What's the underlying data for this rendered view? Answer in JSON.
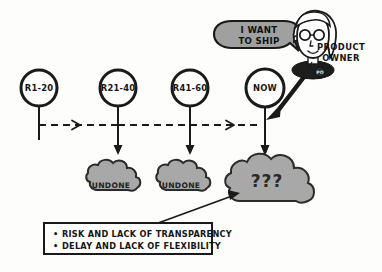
{
  "diagram": {
    "background_color": "#fdfdfc",
    "ink_color": "#1a1a1a",
    "cloud_fill": "#a8a8a8",
    "bubble_fill": "#a0a0a0"
  },
  "timeline": {
    "style": "dashed",
    "nodes": [
      {
        "label": "R1-20",
        "shape": "circle"
      },
      {
        "label": "R21-40",
        "shape": "circle"
      },
      {
        "label": "R41-60",
        "shape": "circle"
      },
      {
        "label": "NOW",
        "shape": "circle"
      }
    ]
  },
  "clouds": [
    {
      "label": "UNDONE",
      "size": "small"
    },
    {
      "label": "UNDONE",
      "size": "small"
    },
    {
      "label": "???",
      "size": "large"
    }
  ],
  "speech_bubble": {
    "lines": [
      "I WANT",
      "TO SHIP"
    ]
  },
  "character": {
    "role_lines": [
      "PRODUCT",
      "OWNER"
    ],
    "badge": "PO"
  },
  "callout": {
    "bullets": [
      "RISK AND LACK OF TRANSPARENCY",
      "DELAY AND LACK OF FLEXIBILITY"
    ],
    "bullet_glyph": "•"
  }
}
